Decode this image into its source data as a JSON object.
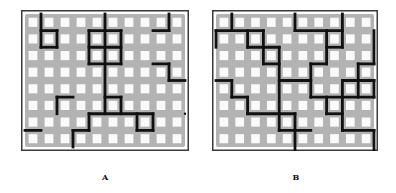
{
  "figure": {
    "panels": [
      {
        "id": "A",
        "label": "A",
        "frame": {
          "x": 21,
          "y": 10,
          "w": 168,
          "h": 141
        },
        "grid": {
          "cols": 10,
          "rows": 8
        },
        "colors": {
          "frame": "#3a3a3a",
          "background": "#b3b3b3",
          "cell": "#fafafa",
          "line": "#111111"
        },
        "segments": [
          [
            1,
            0,
            1,
            2
          ],
          [
            1,
            1,
            2,
            1
          ],
          [
            2,
            1,
            2,
            2
          ],
          [
            1,
            2,
            2,
            2
          ],
          [
            5,
            0,
            5,
            6
          ],
          [
            4,
            1,
            6,
            1
          ],
          [
            4,
            1,
            4,
            3
          ],
          [
            6,
            1,
            6,
            3
          ],
          [
            4,
            2,
            6,
            2
          ],
          [
            4,
            3,
            6,
            3
          ],
          [
            9,
            0,
            9,
            1
          ],
          [
            8,
            1,
            9,
            1
          ],
          [
            8,
            3,
            9,
            3
          ],
          [
            9,
            3,
            9,
            4
          ],
          [
            9,
            4,
            10,
            4
          ],
          [
            2,
            5,
            3,
            5
          ],
          [
            2,
            5,
            2,
            6
          ],
          [
            0,
            7,
            1,
            7
          ],
          [
            5,
            5,
            6,
            5
          ],
          [
            6,
            5,
            6,
            6
          ],
          [
            4,
            6,
            8,
            6
          ],
          [
            7,
            6,
            7,
            7
          ],
          [
            8,
            6,
            8,
            7
          ],
          [
            7,
            7,
            8,
            7
          ],
          [
            4,
            6,
            4,
            7
          ],
          [
            3,
            7,
            4,
            7
          ],
          [
            3,
            7,
            3,
            8
          ]
        ],
        "dots": [
          [
            10,
            6
          ]
        ]
      },
      {
        "id": "B",
        "label": "B",
        "frame": {
          "x": 212,
          "y": 10,
          "w": 166,
          "h": 141
        },
        "grid": {
          "cols": 10,
          "rows": 8
        },
        "colors": {
          "frame": "#3a3a3a",
          "background": "#b3b3b3",
          "cell": "#fafafa",
          "line": "#111111"
        },
        "segments": [
          [
            1,
            0,
            1,
            1
          ],
          [
            0,
            1,
            3,
            1
          ],
          [
            0,
            1,
            0,
            2
          ],
          [
            2,
            1,
            2,
            2
          ],
          [
            2,
            2,
            4,
            2
          ],
          [
            3,
            1,
            3,
            3
          ],
          [
            3,
            3,
            4,
            3
          ],
          [
            4,
            2,
            4,
            7
          ],
          [
            0,
            4,
            1,
            4
          ],
          [
            1,
            4,
            1,
            5
          ],
          [
            1,
            5,
            2,
            5
          ],
          [
            2,
            5,
            2,
            6
          ],
          [
            2,
            6,
            5,
            6
          ],
          [
            5,
            6,
            5,
            8.3
          ],
          [
            4,
            7,
            6,
            7
          ],
          [
            4,
            4,
            6,
            4
          ],
          [
            5,
            0,
            5,
            1
          ],
          [
            5,
            1,
            8,
            1
          ],
          [
            8,
            0,
            8,
            2
          ],
          [
            7,
            2,
            8,
            2
          ],
          [
            7,
            1,
            7,
            3
          ],
          [
            6,
            3,
            7,
            3
          ],
          [
            6,
            3,
            6,
            5
          ],
          [
            6,
            5,
            10,
            5
          ],
          [
            7,
            5,
            7,
            6
          ],
          [
            7,
            6,
            8,
            6
          ],
          [
            10,
            1,
            10,
            3
          ],
          [
            9,
            3,
            10,
            3
          ],
          [
            9,
            3,
            9,
            5
          ],
          [
            8,
            4,
            10,
            4
          ],
          [
            10,
            4,
            10,
            5
          ],
          [
            8,
            4,
            8,
            7
          ],
          [
            8,
            7,
            10,
            7
          ],
          [
            10,
            7,
            10,
            8.3
          ]
        ],
        "dots": []
      }
    ]
  }
}
